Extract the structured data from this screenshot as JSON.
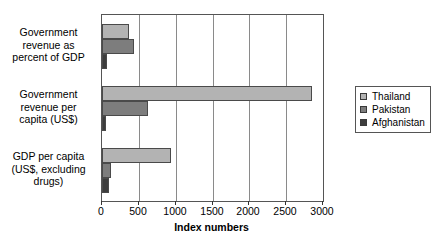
{
  "chart_data": {
    "type": "bar",
    "orientation": "horizontal",
    "title": "",
    "xlabel": "Index numbers",
    "ylabel": "",
    "xlim": [
      0,
      3000
    ],
    "xticks": [
      0,
      500,
      1000,
      1500,
      2000,
      2500,
      3000
    ],
    "grid": true,
    "legend_position": "right",
    "categories": [
      "Government revenue as percent of GDP",
      "Government revenue per capita (US$)",
      "GDP per capita (US$, excluding drugs)"
    ],
    "category_label_lines": [
      [
        "Government",
        "revenue as",
        "percent of GDP"
      ],
      [
        "Government",
        "revenue per",
        "capita (US$)"
      ],
      [
        "GDP per capita",
        "(US$, excluding",
        "drugs)"
      ]
    ],
    "series": [
      {
        "name": "Thailand",
        "color": "#b3b3b3",
        "values": [
          370,
          2850,
          935
        ]
      },
      {
        "name": "Pakistan",
        "color": "#7d7d7d",
        "values": [
          430,
          625,
          120
        ]
      },
      {
        "name": "Afghanistan",
        "color": "#3d3d3d",
        "values": [
          70,
          60,
          90
        ]
      }
    ]
  },
  "legend": {
    "items": [
      {
        "label": "Thailand",
        "color": "#b3b3b3"
      },
      {
        "label": "Pakistan",
        "color": "#7d7d7d"
      },
      {
        "label": "Afghanistan",
        "color": "#3d3d3d"
      }
    ]
  },
  "axis": {
    "x_title": "Index numbers",
    "tick_labels": [
      "0",
      "500",
      "1000",
      "1500",
      "2000",
      "2500",
      "3000"
    ]
  }
}
